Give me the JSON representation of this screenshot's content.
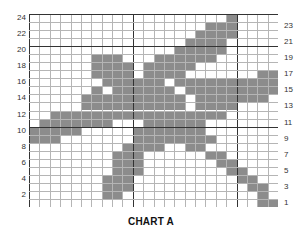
{
  "title": "CHART A",
  "grid": {
    "columns": 24,
    "rows": 24,
    "major_every": 10,
    "fill_color": "#8c8c8c",
    "line_color": "#b5b5b5",
    "major_line_color": "#333333"
  },
  "left_row_labels": [
    "2",
    "4",
    "6",
    "8",
    "10",
    "12",
    "14",
    "16",
    "18",
    "20",
    "22",
    "24"
  ],
  "right_row_labels": [
    "1",
    "3",
    "5",
    "7",
    "9",
    "11",
    "13",
    "15",
    "17",
    "19",
    "21",
    "23"
  ],
  "filled_cells_by_row": {
    "24": [
      20
    ],
    "23": [
      18,
      19,
      20
    ],
    "22": [
      17,
      18,
      19,
      20
    ],
    "21": [
      16,
      17,
      18,
      19
    ],
    "20": [
      15,
      16,
      17,
      18,
      19
    ],
    "19": [
      7,
      8,
      9,
      13,
      14,
      15,
      16,
      17,
      18
    ],
    "18": [
      7,
      8,
      9,
      10,
      12,
      13,
      14,
      15,
      16
    ],
    "17": [
      7,
      8,
      9,
      10,
      12,
      13,
      14,
      15,
      23,
      24
    ],
    "16": [
      8,
      9,
      10,
      11,
      12,
      13,
      15,
      16,
      17,
      18,
      19,
      20,
      21,
      22,
      23,
      24
    ],
    "15": [
      7,
      9,
      10,
      11,
      12,
      13,
      14,
      16,
      17,
      18,
      19,
      20,
      21,
      22,
      23,
      24
    ],
    "14": [
      6,
      7,
      8,
      9,
      10,
      11,
      12,
      13,
      14,
      15,
      17,
      18,
      19,
      20,
      21,
      22,
      23
    ],
    "13": [
      6,
      7,
      8,
      9,
      10,
      11,
      12,
      13,
      14,
      15,
      17,
      18,
      19,
      20
    ],
    "12": [
      3,
      4,
      5,
      6,
      7,
      8,
      9,
      10,
      11,
      12,
      13,
      14,
      15,
      16,
      17,
      18,
      19
    ],
    "11": [
      2,
      3,
      4,
      5,
      6,
      7,
      8,
      12,
      13,
      14,
      15,
      16,
      17
    ],
    "10": [
      1,
      2,
      3,
      4,
      5,
      11,
      12,
      13,
      14,
      15,
      16,
      17
    ],
    "9": [
      1,
      2,
      3,
      11,
      12,
      13,
      14,
      15,
      16,
      17,
      18
    ],
    "8": [
      10,
      11,
      12,
      13,
      16,
      17
    ],
    "7": [
      9,
      10,
      11,
      18,
      19
    ],
    "6": [
      9,
      10,
      11,
      19,
      20
    ],
    "5": [
      9,
      10,
      11,
      20,
      21
    ],
    "4": [
      8,
      9,
      10,
      21,
      22
    ],
    "3": [
      8,
      9,
      10,
      22,
      23
    ],
    "2": [
      8,
      9,
      23
    ],
    "1": [
      23,
      24
    ]
  }
}
